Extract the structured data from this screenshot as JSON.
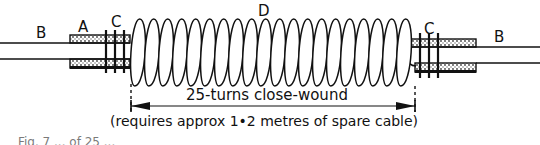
{
  "figure": {
    "labels": {
      "cable_left": "B",
      "sleeve_left": "A",
      "tape_left": "C",
      "coil": "D",
      "tape_right": "C",
      "cable_right": "B"
    },
    "dimension": {
      "text": "25-turns close-wound",
      "note": "(requires approx 1•2 metres of spare cable)"
    },
    "caption_fragment": "Fig. 7  ...  of 25 ..."
  },
  "colors": {
    "ink": "#111111",
    "background": "#ffffff",
    "stipple": "#555555"
  }
}
